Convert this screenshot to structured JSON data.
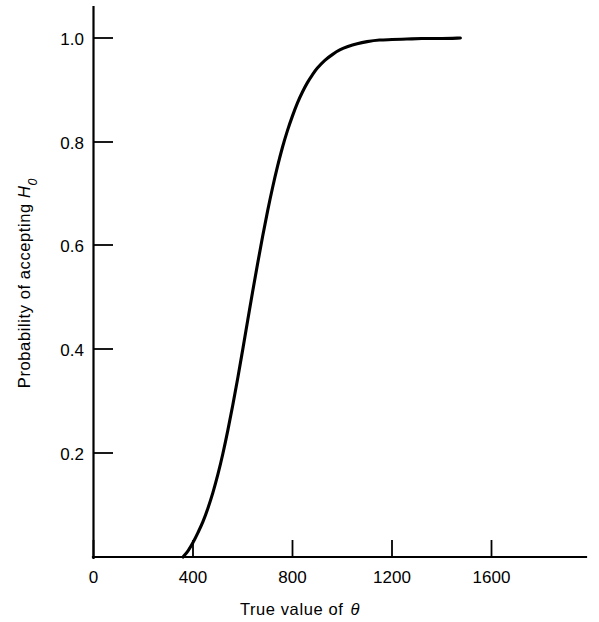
{
  "chart_data": {
    "type": "line",
    "title": "",
    "subtitle": "",
    "xlabel": "True value of θ",
    "ylabel": "Probability of accepting H₀",
    "ylabel_parts": {
      "text": "Probability of accepting ",
      "symbol": "H",
      "subscript": "0"
    },
    "xlabel_parts": {
      "text": "True value of ",
      "symbol": "θ"
    },
    "xlim": [
      0,
      1975
    ],
    "ylim": [
      0,
      1.06
    ],
    "xticks": [
      0,
      400,
      800,
      1200,
      1600
    ],
    "xticklabels": [
      "0",
      "400",
      "800",
      "1200",
      "1600"
    ],
    "yticks": [
      0.2,
      0.4,
      0.6,
      0.8,
      1.0
    ],
    "yticklabels": [
      "0.2",
      "0.4",
      "0.6",
      "0.8",
      "1.0"
    ],
    "grid": false,
    "legend": null,
    "line_color": "#000000",
    "background_color": "#ffffff",
    "series": [
      {
        "name": "Operating characteristic curve",
        "x": [
          360,
          380,
          400,
          420,
          440,
          460,
          480,
          500,
          520,
          540,
          560,
          580,
          600,
          620,
          640,
          660,
          680,
          700,
          720,
          740,
          760,
          780,
          800,
          820,
          840,
          860,
          880,
          900,
          930,
          960,
          990,
          1020,
          1060,
          1100,
          1150,
          1200,
          1260,
          1320,
          1400,
          1475
        ],
        "y": [
          0.0,
          0.012,
          0.028,
          0.047,
          0.068,
          0.094,
          0.124,
          0.159,
          0.199,
          0.244,
          0.293,
          0.345,
          0.4,
          0.456,
          0.512,
          0.566,
          0.618,
          0.667,
          0.712,
          0.753,
          0.79,
          0.822,
          0.85,
          0.875,
          0.896,
          0.914,
          0.929,
          0.942,
          0.957,
          0.968,
          0.977,
          0.983,
          0.989,
          0.993,
          0.996,
          0.997,
          0.998,
          0.999,
          0.999,
          1.0
        ]
      }
    ],
    "annotations": []
  },
  "axes": {
    "x_axis_name": "x-axis",
    "y_axis_name": "y-axis"
  }
}
